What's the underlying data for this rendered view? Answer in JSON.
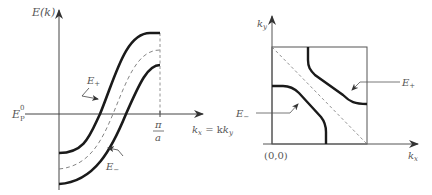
{
  "left_panel": {
    "y_axis_label": "E(k)",
    "x_axis_label": "k",
    "x_axis_label_sub_x": "x",
    "x_axis_label_eq": " = k",
    "x_axis_label_sub_y": "y",
    "fermi_label": "E",
    "fermi_label_sup": "0",
    "fermi_label_sub": "P",
    "tick_label_num": "π",
    "tick_label_den": "a",
    "curve_upper_label": "E",
    "curve_upper_sub": "+",
    "curve_lower_label": "E",
    "curve_lower_sub": "−"
  },
  "right_panel": {
    "y_axis_label": "k",
    "y_axis_label_sub": "y",
    "x_axis_label": "k",
    "x_axis_label_sub": "x",
    "origin_label": "(0,0)",
    "curve_upper_label": "E",
    "curve_upper_sub": "+",
    "curve_lower_label": "E",
    "curve_lower_sub": "−"
  },
  "colors": {
    "curve": "#1a1a1a",
    "axis": "#444444",
    "dashed": "#777777",
    "text": "#555555"
  }
}
